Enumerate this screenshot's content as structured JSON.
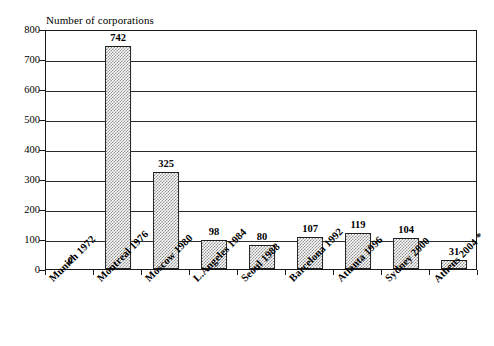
{
  "chart_data": {
    "type": "bar",
    "title": "",
    "ylabel": "Number of corporations",
    "xlabel": "",
    "categories": [
      "Munich 1972",
      "Montreal 1976",
      "Moscow 1980",
      "L.Angeles 1984",
      "Seoul 1988",
      "Barcelona 1992",
      "Atlanta 1996",
      "Sydney 2000",
      "Athens 2004 *"
    ],
    "values": [
      0,
      742,
      325,
      98,
      80,
      107,
      119,
      104,
      31
    ],
    "value_labels": [
      "0",
      "742",
      "325",
      "98",
      "80",
      "107",
      "119",
      "104",
      "31"
    ],
    "ylim": [
      0,
      800
    ],
    "ytick_values": [
      0,
      100,
      200,
      300,
      400,
      500,
      600,
      700,
      800
    ],
    "ytick_labels": [
      "0",
      "100",
      "200",
      "300",
      "400",
      "500",
      "600",
      "700",
      "800"
    ],
    "grid": "horizontal",
    "legend": "none",
    "bar_fill": "#8d8d8d",
    "bar_edge": "#1f1f1f",
    "axis_color": "#1a1a1a",
    "background": "#ffffff",
    "footnote_marker": "*"
  }
}
